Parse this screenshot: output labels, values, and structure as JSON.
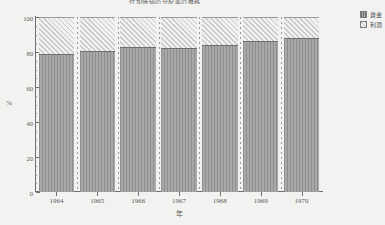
{
  "chart_data": {
    "type": "bar",
    "subtype": "stacked-100-percent",
    "title": "付加価値の分配率の推移",
    "xlabel": "年",
    "ylabel": "%",
    "ylim": [
      0,
      100
    ],
    "yticks": [
      0,
      20,
      40,
      60,
      80,
      100
    ],
    "ytick_labels": [
      "0",
      "20",
      "40",
      "60",
      "80",
      "100"
    ],
    "grid": false,
    "legend_position": "right-top",
    "categories": [
      "1964",
      "1965",
      "1966",
      "1967",
      "1968",
      "1969",
      "1970"
    ],
    "series": [
      {
        "name": "賃金",
        "fill": "vertical-stripes",
        "color": "#9a9a9a",
        "values": [
          79,
          80.5,
          83,
          82.5,
          84,
          86.5,
          88
        ]
      },
      {
        "name": "利潤",
        "fill": "diagonal-hatch",
        "color": "#e9e9e7",
        "values": [
          21,
          19.5,
          17,
          17.5,
          16,
          13.5,
          12
        ]
      }
    ]
  },
  "legend": {
    "items": [
      {
        "label": "賃金",
        "swatch": "wages"
      },
      {
        "label": "利潤",
        "swatch": "profit"
      }
    ]
  }
}
